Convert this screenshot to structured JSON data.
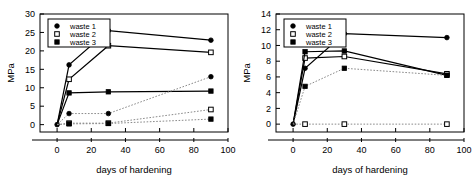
{
  "figure": {
    "panel_count": 2
  },
  "chart_data": [
    {
      "type": "line",
      "panel": "left",
      "title": "",
      "xlabel": "days of hardening",
      "ylabel": "MPa",
      "xlim": [
        -10,
        100
      ],
      "ylim": [
        -2,
        30
      ],
      "xticks": [
        0,
        20,
        40,
        60,
        80,
        100
      ],
      "yticks": [
        0,
        5,
        10,
        15,
        20,
        25,
        30
      ],
      "xtick_labels": [
        "0",
        "20",
        "40",
        "60",
        "80",
        "100"
      ],
      "ytick_labels": [
        "0",
        "5",
        "10",
        "15",
        "20",
        "25",
        "30"
      ],
      "grid": false,
      "legend_position": "top-left",
      "x": [
        0,
        7,
        30,
        90
      ],
      "series": [
        {
          "name": "waste 1",
          "marker": "filled-circle",
          "line": "solid",
          "values": [
            0,
            16.2,
            25.5,
            22.9
          ]
        },
        {
          "name": "waste 2",
          "marker": "open-square",
          "line": "solid",
          "values": [
            0,
            12.3,
            21.4,
            19.6
          ]
        },
        {
          "name": "waste 3",
          "marker": "filled-square",
          "line": "solid",
          "values": [
            0,
            8.6,
            8.9,
            9.1
          ]
        },
        {
          "name": "waste 1 dotted",
          "marker": "filled-circle",
          "line": "dotted",
          "values": [
            0,
            3.0,
            3.0,
            13.0
          ]
        },
        {
          "name": "waste 2 dotted",
          "marker": "open-square",
          "line": "dotted",
          "values": [
            0,
            0.4,
            0.4,
            4.1
          ]
        },
        {
          "name": "waste 3 dotted",
          "marker": "filled-square",
          "line": "dotted",
          "values": [
            0,
            0.2,
            0.3,
            1.5
          ]
        }
      ],
      "legend": [
        {
          "label": "waste 1",
          "marker": "filled-circle"
        },
        {
          "label": "waste 2",
          "marker": "open-square"
        },
        {
          "label": "waste 3",
          "marker": "filled-square"
        }
      ]
    },
    {
      "type": "line",
      "panel": "right",
      "title": "",
      "xlabel": "days of hardening",
      "ylabel": "MPa",
      "xlim": [
        -10,
        100
      ],
      "ylim": [
        -1,
        14
      ],
      "xticks": [
        0,
        20,
        40,
        60,
        80,
        100
      ],
      "yticks": [
        0,
        2,
        4,
        6,
        8,
        10,
        12,
        14
      ],
      "xtick_labels": [
        "0",
        "20",
        "40",
        "60",
        "80",
        "100"
      ],
      "ytick_labels": [
        "0",
        "2",
        "4",
        "6",
        "8",
        "10",
        "12",
        "14"
      ],
      "grid": false,
      "legend_position": "top-left",
      "x": [
        0,
        7,
        30,
        90
      ],
      "series": [
        {
          "name": "waste 1",
          "marker": "filled-circle",
          "line": "solid",
          "values": [
            0,
            7.1,
            11.5,
            11.0
          ]
        },
        {
          "name": "waste 2",
          "marker": "open-square",
          "line": "solid",
          "values": [
            0,
            8.4,
            8.6,
            6.4
          ]
        },
        {
          "name": "waste 3",
          "marker": "filled-square",
          "line": "solid",
          "values": [
            0,
            9.2,
            9.3,
            6.2
          ]
        },
        {
          "name": "waste 1 dotted",
          "marker": "filled-square",
          "line": "dotted",
          "values": [
            0,
            4.8,
            7.1,
            6.2
          ]
        },
        {
          "name": "waste 2 dotted",
          "marker": "open-square",
          "line": "dotted",
          "values": [
            0,
            0,
            0,
            0
          ]
        }
      ],
      "legend": [
        {
          "label": "waste 1",
          "marker": "filled-circle"
        },
        {
          "label": "waste 2",
          "marker": "open-square"
        },
        {
          "label": "waste 3",
          "marker": "filled-square"
        }
      ]
    }
  ]
}
